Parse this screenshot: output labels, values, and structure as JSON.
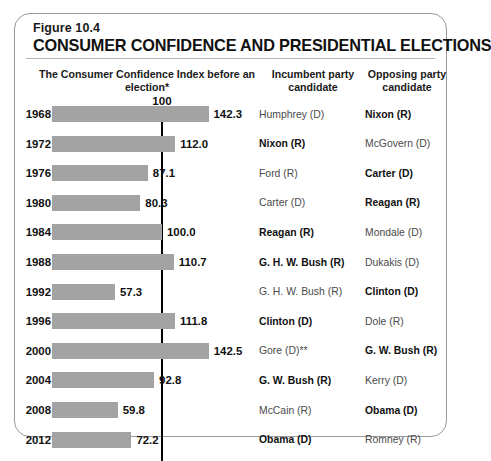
{
  "figure": {
    "number": "Figure 10.4",
    "title": "CONSUMER CONFIDENCE AND PRESIDENTIAL ELECTIONS"
  },
  "columns": {
    "index_header": "The Consumer Confidence Index before an election*",
    "incumbent_header": "Incumbent party candidate",
    "opposing_header": "Opposing party candidate"
  },
  "axis": {
    "reference_label": "100",
    "reference_value": 100
  },
  "chart_data": {
    "type": "bar",
    "title": "CONSUMER CONFIDENCE AND PRESIDENTIAL ELECTIONS",
    "subtitle": "Figure 10.4",
    "orientation": "horizontal",
    "xlabel": "The Consumer Confidence Index before an election*",
    "ylabel": "",
    "categories": [
      "1968",
      "1972",
      "1976",
      "1980",
      "1984",
      "1988",
      "1992",
      "1996",
      "2000",
      "2004",
      "2008",
      "2012"
    ],
    "values": [
      142.3,
      112.0,
      87.1,
      80.3,
      100.0,
      110.7,
      57.3,
      111.8,
      142.5,
      92.8,
      59.8,
      72.2
    ],
    "value_labels": [
      "142.3",
      "112.0",
      "87.1",
      "80.3",
      "100.0",
      "110.7",
      "57.3",
      "111.8",
      "142.5",
      "92.8",
      "59.8",
      "72.2"
    ],
    "xlim": [
      0,
      150
    ],
    "grid": false,
    "legend": null,
    "reference_line": {
      "value": 100,
      "label": "100",
      "color": "#000000"
    },
    "bar_color": "#a3a3a3",
    "annotations": [
      {
        "text": "*",
        "note": "asterisk on index column header"
      },
      {
        "text": "**",
        "note": "double asterisk on Gore (D)"
      }
    ],
    "table_columns": [
      "Year",
      "Consumer Confidence Index",
      "Incumbent party candidate",
      "Opposing party candidate"
    ]
  },
  "rows": [
    {
      "year": "1968",
      "value": 142.3,
      "value_label": "142.3",
      "incumbent": {
        "name": "Humphrey (D)",
        "winner": false
      },
      "opposing": {
        "name": "Nixon (R)",
        "winner": true
      }
    },
    {
      "year": "1972",
      "value": 112.0,
      "value_label": "112.0",
      "incumbent": {
        "name": "Nixon (R)",
        "winner": true
      },
      "opposing": {
        "name": "McGovern (D)",
        "winner": false
      }
    },
    {
      "year": "1976",
      "value": 87.1,
      "value_label": "87.1",
      "incumbent": {
        "name": "Ford (R)",
        "winner": false
      },
      "opposing": {
        "name": "Carter (D)",
        "winner": true
      }
    },
    {
      "year": "1980",
      "value": 80.3,
      "value_label": "80.3",
      "incumbent": {
        "name": "Carter (D)",
        "winner": false
      },
      "opposing": {
        "name": "Reagan (R)",
        "winner": true
      }
    },
    {
      "year": "1984",
      "value": 100.0,
      "value_label": "100.0",
      "incumbent": {
        "name": "Reagan (R)",
        "winner": true
      },
      "opposing": {
        "name": "Mondale (D)",
        "winner": false
      }
    },
    {
      "year": "1988",
      "value": 110.7,
      "value_label": "110.7",
      "incumbent": {
        "name": "G. H. W. Bush (R)",
        "winner": true
      },
      "opposing": {
        "name": "Dukakis (D)",
        "winner": false
      }
    },
    {
      "year": "1992",
      "value": 57.3,
      "value_label": "57.3",
      "incumbent": {
        "name": "G. H. W. Bush (R)",
        "winner": false
      },
      "opposing": {
        "name": "Clinton (D)",
        "winner": true
      }
    },
    {
      "year": "1996",
      "value": 111.8,
      "value_label": "111.8",
      "incumbent": {
        "name": "Clinton (D)",
        "winner": true
      },
      "opposing": {
        "name": "Dole (R)",
        "winner": false
      }
    },
    {
      "year": "2000",
      "value": 142.5,
      "value_label": "142.5",
      "incumbent": {
        "name": "Gore (D)**",
        "winner": false
      },
      "opposing": {
        "name": "G. W. Bush (R)",
        "winner": true
      }
    },
    {
      "year": "2004",
      "value": 92.8,
      "value_label": "92.8",
      "incumbent": {
        "name": "G. W. Bush (R)",
        "winner": true
      },
      "opposing": {
        "name": "Kerry (D)",
        "winner": false
      }
    },
    {
      "year": "2008",
      "value": 59.8,
      "value_label": "59.8",
      "incumbent": {
        "name": "McCain (R)",
        "winner": false
      },
      "opposing": {
        "name": "Obama (D)",
        "winner": true
      }
    },
    {
      "year": "2012",
      "value": 72.2,
      "value_label": "72.2",
      "incumbent": {
        "name": "Obama (D)",
        "winner": true
      },
      "opposing": {
        "name": "Romney (R)",
        "winner": false
      }
    }
  ]
}
